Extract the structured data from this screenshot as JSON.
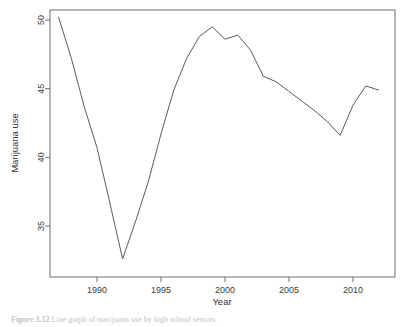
{
  "figure": {
    "caption_label": "Figure 3.12",
    "caption_text": "Line graph of marijuana use by high school seniors."
  },
  "chart_data": {
    "type": "line",
    "title": "",
    "xlabel": "Year",
    "ylabel": "Marijuana use",
    "xlim": [
      1987,
      2012
    ],
    "ylim": [
      32.5,
      50.4
    ],
    "xticks": [
      1990,
      1995,
      2000,
      2005,
      2010
    ],
    "yticks": [
      35,
      40,
      45,
      50
    ],
    "grid": false,
    "legend": "none",
    "x": [
      1987,
      1988,
      1989,
      1990,
      1991,
      1992,
      1993,
      1994,
      1995,
      1996,
      1997,
      1998,
      1999,
      2000,
      2001,
      2002,
      2003,
      2004,
      2005,
      2006,
      2007,
      2008,
      2009,
      2010,
      2011,
      2012
    ],
    "values": [
      50.2,
      47.2,
      43.7,
      40.7,
      36.7,
      32.6,
      35.3,
      38.2,
      41.7,
      44.9,
      47.2,
      48.8,
      49.5,
      48.6,
      48.9,
      47.8,
      45.9,
      45.5,
      44.8,
      44.1,
      43.4,
      42.6,
      41.6,
      43.8,
      45.2,
      44.9
    ],
    "series": [
      {
        "name": "Marijuana use",
        "values": [
          50.2,
          47.2,
          43.7,
          40.7,
          36.7,
          32.6,
          35.3,
          38.2,
          41.7,
          44.9,
          47.2,
          48.8,
          49.5,
          48.6,
          48.9,
          47.8,
          45.9,
          45.5,
          44.8,
          44.1,
          43.4,
          42.6,
          41.6,
          43.8,
          45.2,
          44.9
        ]
      }
    ],
    "line_color": "#5a5a5a",
    "axis_color": "#6f6f6f"
  }
}
